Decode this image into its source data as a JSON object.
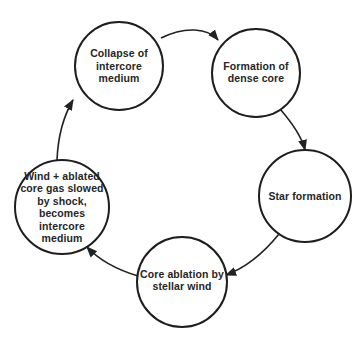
{
  "diagram": {
    "type": "cycle",
    "colors": {
      "stroke": "#1e1e1e",
      "text": "#262626",
      "background": "#ffffff"
    },
    "nodes": [
      {
        "id": "collapse",
        "label": "Collapse of intercore medium",
        "cx": 119,
        "cy": 66,
        "r": 44
      },
      {
        "id": "formation",
        "label": "Formation of dense core",
        "cx": 256,
        "cy": 73,
        "r": 44
      },
      {
        "id": "star",
        "label": "Star formation",
        "cx": 305,
        "cy": 196,
        "r": 46
      },
      {
        "id": "ablation",
        "label": "Core ablation by stellar wind",
        "cx": 182,
        "cy": 282,
        "r": 45
      },
      {
        "id": "wind",
        "label": "Wind + ablated core gas slowed by shock, becomes intercore medium",
        "cx": 62,
        "cy": 207,
        "r": 47
      }
    ],
    "edges": [
      {
        "from": "collapse",
        "to": "formation"
      },
      {
        "from": "formation",
        "to": "star"
      },
      {
        "from": "star",
        "to": "ablation"
      },
      {
        "from": "ablation",
        "to": "wind"
      },
      {
        "from": "wind",
        "to": "collapse"
      }
    ]
  }
}
